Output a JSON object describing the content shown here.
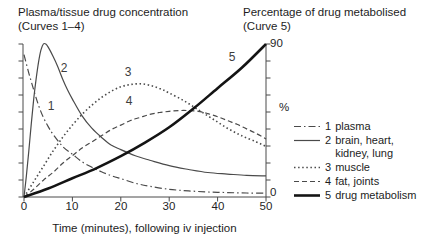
{
  "titles": {
    "left_line1": "Plasma/tissue drug concentration",
    "left_line2": "(Curves 1–4)",
    "right_line1": "Percentage of drug metabolised",
    "right_line2": "(Curve 5)"
  },
  "axis": {
    "x_label": "Time (minutes), following iv injection",
    "x_ticks": [
      "0",
      "10",
      "20",
      "30",
      "40",
      "50"
    ],
    "right_axis_top": "90",
    "right_axis_bottom": "0",
    "percent_symbol": "%"
  },
  "legend": {
    "items": [
      {
        "num": "1",
        "label": "plasma",
        "label2": "",
        "style": "dashdot"
      },
      {
        "num": "2",
        "label": "brain, heart,",
        "label2": "kidney, lung",
        "style": "solid"
      },
      {
        "num": "3",
        "label": "muscle",
        "label2": "",
        "style": "dotted"
      },
      {
        "num": "4",
        "label": "fat, joints",
        "label2": "",
        "style": "dashed"
      },
      {
        "num": "5",
        "label": "drug metabolism",
        "label2": "",
        "style": "thick"
      }
    ]
  },
  "colors": {
    "text": "#1f1f1f",
    "axis": "#4a4a4a",
    "curve_thin": "#4a4a4a",
    "curve_thick": "#141414",
    "curve_label": "#3d3d3d"
  },
  "chart_data": {
    "type": "line",
    "title_left": "Plasma/tissue drug concentration (Curves 1–4)",
    "title_right": "Percentage of drug metabolised (Curve 5)",
    "xlabel": "Time (minutes), following iv injection",
    "x_range": [
      0,
      50
    ],
    "x_tick_interval": 10,
    "left_axis": {
      "numeric_labels": false,
      "range": [
        0,
        100
      ],
      "units": "relative concentration",
      "tick_count": 10
    },
    "right_axis": {
      "label": "%",
      "range": [
        0,
        90
      ],
      "tick_interval": 10,
      "labeled_ticks": [
        0,
        90
      ],
      "tick_count": 10
    },
    "grid": false,
    "legend_position": "right",
    "series": [
      {
        "num": "1",
        "name": "plasma",
        "style": "dashdot",
        "axis": "left",
        "label_xy": [
          51,
          110
        ],
        "points": [
          [
            0,
            93
          ],
          [
            1,
            81
          ],
          [
            2,
            70
          ],
          [
            3,
            60
          ],
          [
            4,
            52
          ],
          [
            5,
            46
          ],
          [
            6,
            41
          ],
          [
            8,
            33
          ],
          [
            10,
            28
          ],
          [
            12,
            23
          ],
          [
            14,
            19.5
          ],
          [
            16,
            16.5
          ],
          [
            18,
            14
          ],
          [
            20,
            12
          ],
          [
            23,
            9
          ],
          [
            26,
            7
          ],
          [
            30,
            5
          ],
          [
            34,
            4
          ],
          [
            38,
            3.3
          ],
          [
            42,
            2.9
          ],
          [
            46,
            2.6
          ],
          [
            50,
            2.5
          ]
        ]
      },
      {
        "num": "2",
        "name": "brain, heart, kidney, lung",
        "style": "solid",
        "axis": "left",
        "label_xy": [
          64,
          72
        ],
        "points": [
          [
            0,
            0
          ],
          [
            0.5,
            14
          ],
          [
            1,
            30
          ],
          [
            1.5,
            48
          ],
          [
            2,
            64
          ],
          [
            2.5,
            77
          ],
          [
            3,
            88
          ],
          [
            3.5,
            96
          ],
          [
            4,
            100
          ],
          [
            4.5,
            100
          ],
          [
            5,
            98
          ],
          [
            6,
            92
          ],
          [
            7,
            85
          ],
          [
            8,
            77
          ],
          [
            9,
            70
          ],
          [
            10,
            64
          ],
          [
            12,
            53
          ],
          [
            14,
            45
          ],
          [
            16,
            39
          ],
          [
            18,
            34
          ],
          [
            20,
            31
          ],
          [
            23,
            27
          ],
          [
            26,
            24
          ],
          [
            30,
            20.5
          ],
          [
            34,
            18
          ],
          [
            38,
            16
          ],
          [
            42,
            15
          ],
          [
            46,
            14.2
          ],
          [
            50,
            13.8
          ]
        ]
      },
      {
        "num": "3",
        "name": "muscle",
        "style": "dotted",
        "axis": "left",
        "label_xy": [
          128,
          76
        ],
        "points": [
          [
            0,
            0
          ],
          [
            2,
            10
          ],
          [
            4,
            20
          ],
          [
            6,
            30
          ],
          [
            8,
            39
          ],
          [
            10,
            47
          ],
          [
            12,
            54
          ],
          [
            14,
            60
          ],
          [
            16,
            65
          ],
          [
            18,
            69
          ],
          [
            20,
            72
          ],
          [
            22,
            73.5
          ],
          [
            24,
            74
          ],
          [
            26,
            73
          ],
          [
            28,
            71
          ],
          [
            30,
            68
          ],
          [
            33,
            63
          ],
          [
            36,
            57
          ],
          [
            39,
            51
          ],
          [
            42,
            45
          ],
          [
            45,
            40
          ],
          [
            48,
            36
          ],
          [
            50,
            33
          ]
        ]
      },
      {
        "num": "4",
        "name": "fat, joints",
        "style": "dashed",
        "axis": "left",
        "label_xy": [
          129,
          105
        ],
        "points": [
          [
            0,
            0
          ],
          [
            2,
            5
          ],
          [
            4,
            11
          ],
          [
            6,
            16
          ],
          [
            8,
            22
          ],
          [
            10,
            27
          ],
          [
            12,
            32
          ],
          [
            14,
            36
          ],
          [
            16,
            40
          ],
          [
            18,
            44
          ],
          [
            20,
            47
          ],
          [
            22,
            50
          ],
          [
            24,
            52
          ],
          [
            26,
            54
          ],
          [
            28,
            55.2
          ],
          [
            30,
            56
          ],
          [
            32,
            56.5
          ],
          [
            34,
            56.5
          ],
          [
            36,
            56
          ],
          [
            38,
            54.5
          ],
          [
            40,
            52.5
          ],
          [
            42,
            50
          ],
          [
            44,
            47.5
          ],
          [
            46,
            44.5
          ],
          [
            48,
            41.5
          ],
          [
            50,
            38
          ]
        ]
      },
      {
        "num": "5",
        "name": "drug metabolism",
        "style": "thick",
        "axis": "right",
        "label_xy": [
          232,
          61
        ],
        "points": [
          [
            0,
            0
          ],
          [
            5,
            5
          ],
          [
            10,
            11
          ],
          [
            15,
            17
          ],
          [
            20,
            24
          ],
          [
            25,
            32
          ],
          [
            30,
            41
          ],
          [
            35,
            52
          ],
          [
            40,
            64
          ],
          [
            45,
            76
          ],
          [
            50,
            90
          ]
        ]
      }
    ]
  }
}
